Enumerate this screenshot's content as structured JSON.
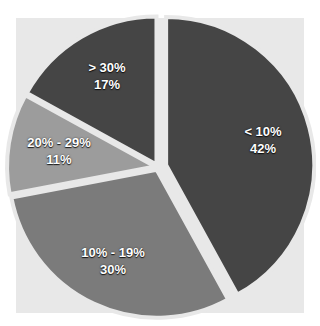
{
  "chart_data": {
    "type": "pie",
    "title": "",
    "categories": [
      "< 10%",
      "10% - 19%",
      "20% - 29%",
      "> 30%"
    ],
    "values": [
      42,
      30,
      11,
      17
    ],
    "value_labels": [
      "42%",
      "30%",
      "11%",
      "17%"
    ],
    "colors": [
      "#454545",
      "#7b7b7b",
      "#9c9c9c",
      "#454545"
    ],
    "exploded": [
      "< 10%"
    ],
    "start_angle": "12 o'clock, clockwise",
    "legend": "none (labels inside slices)"
  },
  "labels": [
    {
      "category": "< 10%",
      "value": "42%"
    },
    {
      "category": "10% - 19%",
      "value": "30%"
    },
    {
      "category": "20% - 29%",
      "value": "11%"
    },
    {
      "category": "> 30%",
      "value": "17%"
    }
  ]
}
